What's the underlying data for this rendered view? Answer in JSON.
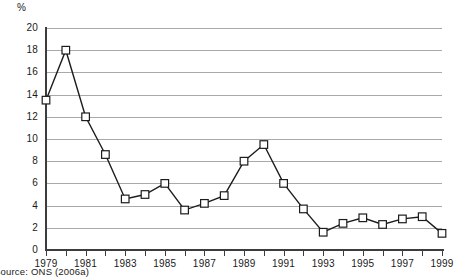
{
  "chart_data": {
    "type": "line",
    "title": "",
    "subtitle": "",
    "xlabel": "",
    "ylabel": "%",
    "unit_label": "%",
    "xlim": [
      1979,
      1999
    ],
    "ylim": [
      0,
      20
    ],
    "ytick_step": 2,
    "xtick_step": 1,
    "xlabel_step": 2,
    "grid": "horizontal",
    "legend": "none",
    "marker": "open-square",
    "line_color": "#1c1c1c",
    "grid_color": "#a9a9a9",
    "axis_color": "#3d3d3d",
    "x": [
      1979,
      1980,
      1981,
      1982,
      1983,
      1984,
      1985,
      1986,
      1987,
      1988,
      1989,
      1990,
      1991,
      1992,
      1993,
      1994,
      1995,
      1996,
      1997,
      1998,
      1999
    ],
    "values": [
      13.5,
      18.0,
      12.0,
      8.6,
      4.6,
      5.0,
      6.0,
      3.6,
      4.2,
      4.9,
      8.0,
      9.5,
      6.0,
      3.7,
      1.6,
      2.4,
      2.9,
      2.3,
      2.8,
      3.0,
      1.5
    ],
    "ytick_labels": [
      "0",
      "2",
      "4",
      "6",
      "8",
      "10",
      "12",
      "14",
      "16",
      "18",
      "20"
    ],
    "xtick_labels": [
      "1979",
      "1981",
      "1983",
      "1985",
      "1987",
      "1989",
      "1991",
      "1993",
      "1995",
      "1997",
      "1999"
    ]
  },
  "source": {
    "text": "Source: ONS (2006a)"
  }
}
